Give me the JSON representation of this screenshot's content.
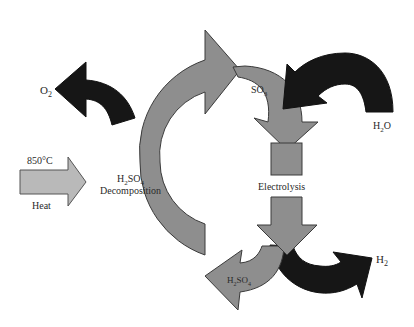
{
  "diagram": {
    "colors": {
      "background": "#ffffff",
      "process_arrow": "#8e8e8e",
      "heat_arrow": "#b9b9b9",
      "product_arrow": "#161616",
      "outline": "#3a3a3a",
      "text": "#2a2a2a"
    },
    "nodes": {
      "decomposition": {
        "line1": "H",
        "line1_sub": "2",
        "line1_b": "SO",
        "line1_sub2": "4",
        "line2": "Decomposition"
      },
      "electrolysis": {
        "label": "Electrolysis"
      }
    },
    "inputs": {
      "heat": {
        "temperature": "850°C",
        "label": "Heat"
      },
      "water": {
        "base": "H",
        "sub": "2",
        "tail": "O"
      }
    },
    "outputs": {
      "oxygen": {
        "base": "O",
        "sub": "2"
      },
      "hydrogen": {
        "base": "H",
        "sub": "2"
      }
    },
    "intermediates": {
      "so3": {
        "base": "SO",
        "sub": "3"
      },
      "h2so4": {
        "base": "H",
        "sub": "2",
        "mid": "SO",
        "sub2": "4"
      }
    }
  }
}
